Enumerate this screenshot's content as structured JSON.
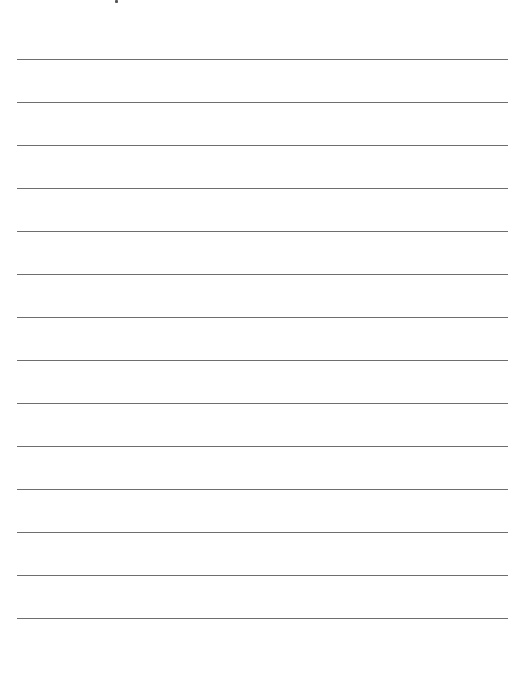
{
  "page": {
    "type": "lined-paper",
    "background_color": "#ffffff",
    "line_color": "#6e6e6e",
    "line_count": 14,
    "line_left": 17,
    "line_width": 491,
    "first_line_y": 59,
    "line_spacing": 43
  }
}
